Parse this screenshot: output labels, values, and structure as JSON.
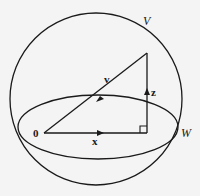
{
  "figure": {
    "labels": {
      "space_V": "V",
      "subspace_W": "W",
      "vector_v": "v",
      "vector_x": "x",
      "vector_z": "z",
      "origin": "0"
    },
    "colors": {
      "stroke": "#1a1a1a",
      "background": "#f4f4f4"
    }
  }
}
